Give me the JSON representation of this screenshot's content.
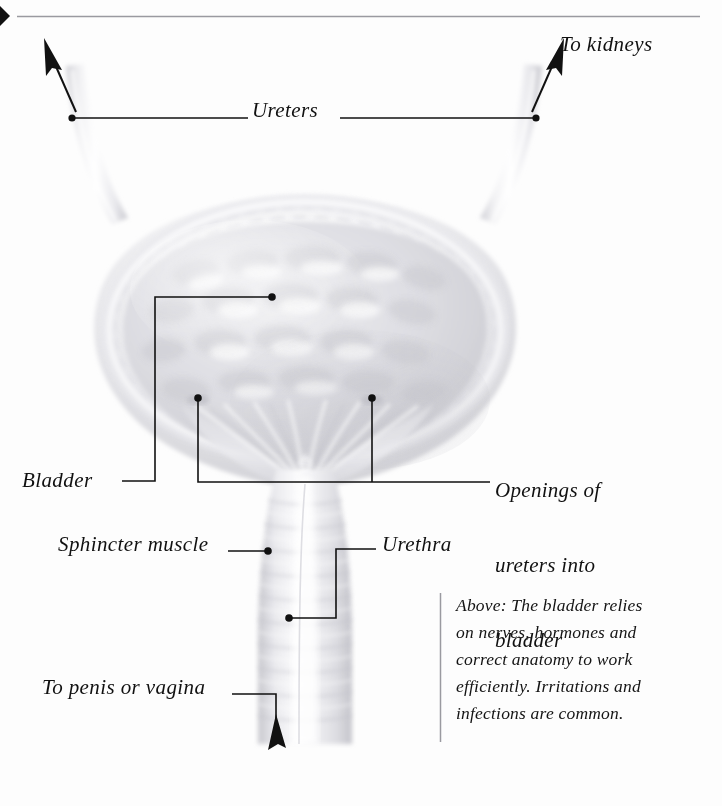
{
  "page": {
    "background_color": "#fdfdfd",
    "ink_color": "#111111",
    "rule_color": "#8d8d93",
    "organ_tint": "#d7d7da"
  },
  "top_rule": {
    "marker_icon": "right-pointing-triangle-marker",
    "line_label": "horizontal-divider"
  },
  "labels": {
    "ureters": "Ureters",
    "to_kidneys": "To kidneys",
    "bladder": "Bladder",
    "openings_line1": "Openings of",
    "openings_line2": "ureters into",
    "openings_line3": "bladder",
    "sphincter": "Sphincter muscle",
    "urethra": "Urethra",
    "to_penis_or_vagina": "To penis or vagina"
  },
  "caption": {
    "line1": "Above: The bladder relies",
    "line2": "on nerves, hormones and",
    "line3": "correct anatomy to work",
    "line4": "efficiently. Irritations and",
    "line5": "infections are common."
  },
  "diagram": {
    "parts": [
      "left ureter",
      "right ureter",
      "bladder dome",
      "bladder wall rugae",
      "trigone",
      "ureteric openings",
      "sphincter muscle",
      "urethra"
    ],
    "arrows": [
      "left-ureter-up-arrow",
      "right-ureter-up-arrow",
      "urethra-down-arrow"
    ]
  }
}
